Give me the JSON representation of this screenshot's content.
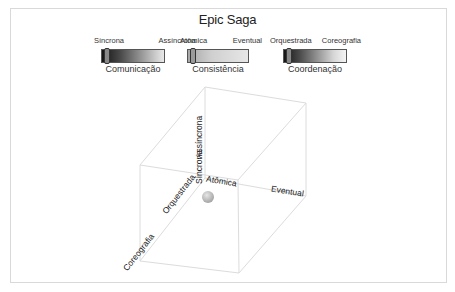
{
  "title": "Epic Saga",
  "sliders": [
    {
      "name": "Comunicação",
      "left_label": "Síncrona",
      "right_label": "Assíncrona",
      "value": "Síncrona",
      "gradient_from": "#1a1a1a",
      "gradient_to": "#e6e6e6"
    },
    {
      "name": "Consistência",
      "left_label": "Atômica",
      "right_label": "Eventual",
      "value": "Atômica",
      "gradient_from": "#9a9a9a",
      "gradient_to": "#e6e6e6"
    },
    {
      "name": "Coordenação",
      "left_label": "Orquestrada",
      "right_label": "Coreografia",
      "value": "Orquestrada",
      "gradient_from": "#1a1a1a",
      "gradient_to": "#f2f2f2"
    }
  ],
  "cube": {
    "axes": {
      "vertical_low": "Síncrona",
      "vertical_high": "Assíncrona",
      "horizontal_low": "Atômica",
      "horizontal_high": "Eventual",
      "depth_low": "Orquestrada",
      "depth_high": "Coreografia"
    },
    "marker": {
      "label": "Epic Saga position",
      "color": "#bdbdbd"
    },
    "edge_color": "#dcdcdc"
  }
}
